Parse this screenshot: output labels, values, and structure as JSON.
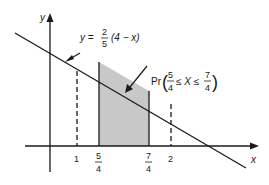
{
  "diagram": {
    "axes": {
      "x_label": "x",
      "y_label": "y"
    },
    "line_equation": {
      "lhs": "y =",
      "frac_num": "2",
      "frac_den": "5",
      "rhs": "(4 − x)"
    },
    "shaded_region_label": {
      "prefix": "Pr",
      "lower_num": "5",
      "lower_den": "4",
      "middle": "≤ X ≤",
      "upper_num": "7",
      "upper_den": "4"
    },
    "x_ticks": [
      {
        "label": "1",
        "style": "dashed"
      },
      {
        "num": "5",
        "den": "4",
        "style": "solid"
      },
      {
        "num": "7",
        "den": "4",
        "style": "solid"
      },
      {
        "label": "2",
        "style": "dashed"
      }
    ],
    "colors": {
      "line": "#1a1a1a",
      "shade": "#c8c8c8"
    }
  }
}
